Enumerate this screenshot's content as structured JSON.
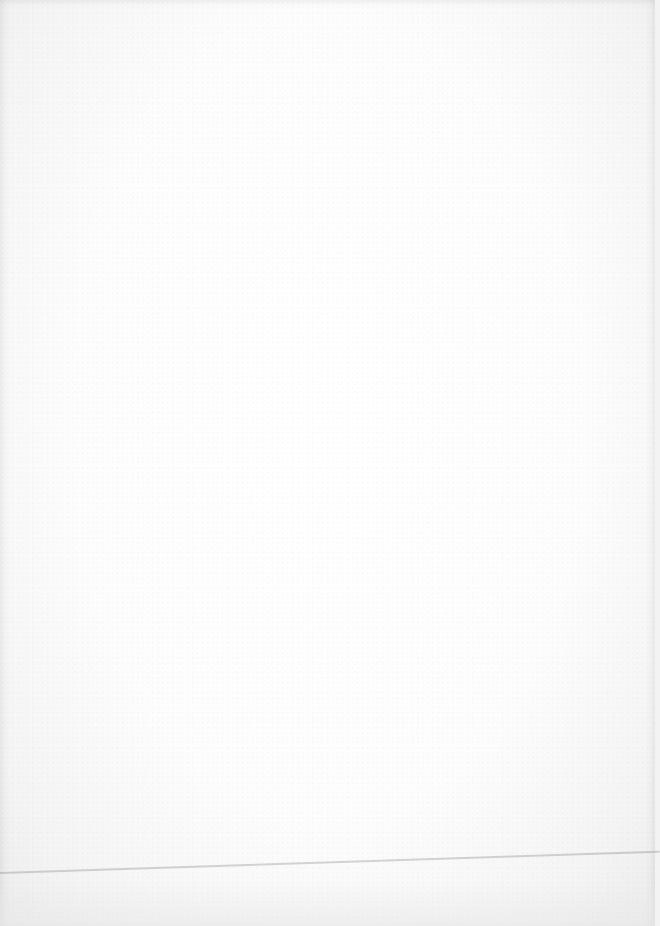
{
  "page": {
    "type": "blank scanned page",
    "text": "",
    "colors": {
      "paper": "#fdfdfd",
      "edge_shadow": "#ececec",
      "line": "#b9b9b9"
    }
  }
}
